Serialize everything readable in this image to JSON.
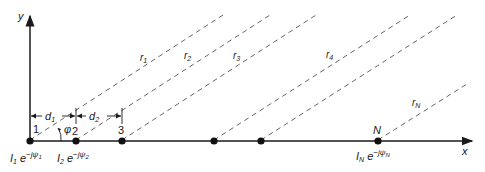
{
  "diagram": {
    "type": "linear-array-geometry",
    "axes": {
      "x_label": "x",
      "y_label": "y"
    },
    "elements": [
      {
        "id": "1",
        "label": "1",
        "x": 30
      },
      {
        "id": "2",
        "label": "2",
        "x": 76
      },
      {
        "id": "3",
        "label": "3",
        "x": 122
      },
      {
        "id": "4",
        "label": "",
        "x": 214
      },
      {
        "id": "5",
        "label": "",
        "x": 261
      },
      {
        "id": "N",
        "label": "N",
        "x": 378
      }
    ],
    "rays": [
      {
        "label_main": "r",
        "label_sub": "1"
      },
      {
        "label_main": "r",
        "label_sub": "2"
      },
      {
        "label_main": "r",
        "label_sub": "3"
      },
      {
        "label_main": "r",
        "label_sub": "4"
      },
      {
        "label_main": "r",
        "label_sub": "N"
      }
    ],
    "spacings": [
      {
        "main": "d",
        "sub": "1"
      },
      {
        "main": "d",
        "sub": "2"
      }
    ],
    "angle_label": "φ",
    "currents": [
      {
        "I": "I",
        "I_sub": "1",
        "e": "e",
        "exp": "−jψ",
        "exp_sub": "1"
      },
      {
        "I": "I",
        "I_sub": "2",
        "e": "e",
        "exp": "−jψ",
        "exp_sub": "2"
      },
      {
        "I": "I",
        "I_sub": "N",
        "e": "e",
        "exp": "−jψ",
        "exp_sub": "N"
      }
    ],
    "colors": {
      "ink": "#1a1a1a",
      "dash": "#555555",
      "background": "#ffffff"
    }
  }
}
